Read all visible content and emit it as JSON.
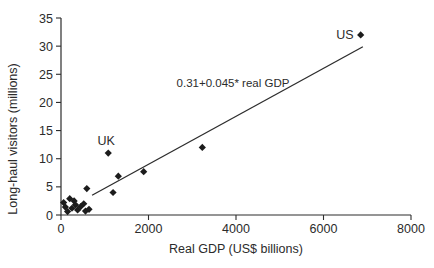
{
  "chart_data": {
    "type": "scatter",
    "title": "",
    "xlabel": "Real GDP (US$ billions)",
    "ylabel": "Long-haul visitors (millions)",
    "xlim": [
      0,
      8000
    ],
    "ylim": [
      0,
      35
    ],
    "x_ticks": [
      0,
      2000,
      4000,
      6000,
      8000
    ],
    "y_ticks": [
      0,
      5,
      10,
      15,
      20,
      25,
      30,
      35
    ],
    "grid": false,
    "legend": "none",
    "marker": "diamond",
    "points": [
      {
        "x": 60,
        "y": 2.2
      },
      {
        "x": 100,
        "y": 1.4
      },
      {
        "x": 150,
        "y": 0.6
      },
      {
        "x": 200,
        "y": 2.9
      },
      {
        "x": 250,
        "y": 1.2
      },
      {
        "x": 300,
        "y": 2.5
      },
      {
        "x": 330,
        "y": 1.8
      },
      {
        "x": 380,
        "y": 0.9
      },
      {
        "x": 450,
        "y": 1.5
      },
      {
        "x": 520,
        "y": 2.0
      },
      {
        "x": 560,
        "y": 0.7
      },
      {
        "x": 640,
        "y": 1.0
      },
      {
        "x": 590,
        "y": 4.7
      },
      {
        "x": 1190,
        "y": 4.0
      },
      {
        "x": 1080,
        "y": 11.0,
        "label": "UK",
        "label_dx": -2,
        "label_dy": -8,
        "label_anchor": "middle"
      },
      {
        "x": 1310,
        "y": 6.9
      },
      {
        "x": 1890,
        "y": 7.7
      },
      {
        "x": 3230,
        "y": 12.0
      },
      {
        "x": 6850,
        "y": 32.0,
        "label": "US",
        "label_dx": -7,
        "label_dy": 4,
        "label_anchor": "end"
      }
    ],
    "trendline": {
      "x1": 710,
      "y1": 3.5,
      "x2": 6900,
      "y2": 29.9,
      "equation_label": "0.31+0.045* real GDP",
      "label_x": 3930,
      "label_y": 22.7
    },
    "colors": {
      "marker": "#1c1c1c",
      "line": "#2d2d2d",
      "axis": "#2d2d2d",
      "text": "#2b2b2b",
      "background": "#ffffff"
    }
  }
}
